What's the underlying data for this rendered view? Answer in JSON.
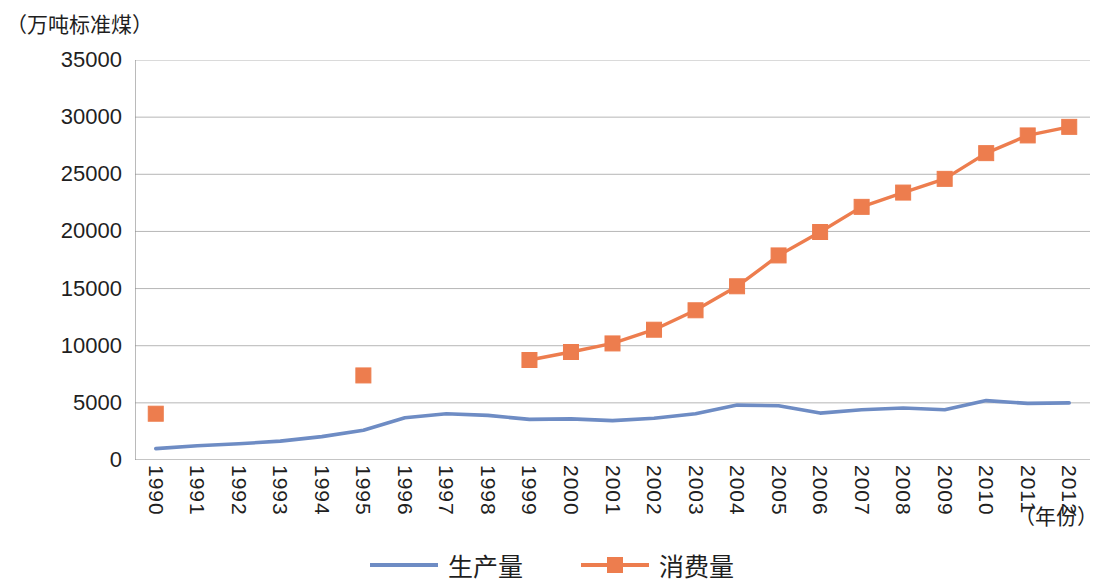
{
  "chart_data": {
    "type": "line",
    "title": "",
    "ylabel": "（万吨标准煤）",
    "xlabel": "（年份）",
    "ylim": [
      0,
      35000
    ],
    "ytick_values": [
      0,
      5000,
      10000,
      15000,
      20000,
      25000,
      30000,
      35000
    ],
    "ytick_labels": [
      "0",
      "5000",
      "10000",
      "15000",
      "20000",
      "25000",
      "30000",
      "35000"
    ],
    "grid": true,
    "legend_position": "bottom",
    "categories": [
      1990,
      1991,
      1992,
      1993,
      1994,
      1995,
      1996,
      1997,
      1998,
      1999,
      2000,
      2001,
      2002,
      2003,
      2004,
      2005,
      2006,
      2007,
      2008,
      2009,
      2010,
      2011,
      2012
    ],
    "xtick_labels": [
      "1990",
      "1991",
      "1992",
      "1993",
      "1994",
      "1995",
      "1996",
      "1997",
      "1998",
      "1999",
      "2000",
      "2001",
      "2002",
      "2003",
      "2004",
      "2005",
      "2006",
      "2007",
      "2008",
      "2009",
      "2010",
      "2011",
      "2012"
    ],
    "series": [
      {
        "name": "生产量",
        "color": "#6E8CC4",
        "marker": "none",
        "values": [
          1000,
          1250,
          1420,
          1650,
          2050,
          2600,
          3700,
          4050,
          3900,
          3550,
          3600,
          3450,
          3650,
          4050,
          4800,
          4750,
          4100,
          4400,
          4550,
          4400,
          5200,
          4950,
          5000
        ]
      },
      {
        "name": "消费量",
        "color": "#ED7D4E",
        "marker": "square",
        "values": [
          4050,
          null,
          null,
          null,
          null,
          7400,
          null,
          null,
          null,
          8750,
          9450,
          10200,
          11400,
          13100,
          15200,
          17900,
          19950,
          22150,
          23400,
          24600,
          26850,
          28400,
          29150
        ]
      }
    ]
  },
  "legend": {
    "items": [
      {
        "label": "生产量",
        "color": "#6E8CC4",
        "marker": "line"
      },
      {
        "label": "消费量",
        "color": "#ED7D4E",
        "marker": "square-line"
      }
    ]
  },
  "axes": {
    "y_unit_caption": "（万吨标准煤）",
    "x_unit_caption": "（年份）"
  }
}
